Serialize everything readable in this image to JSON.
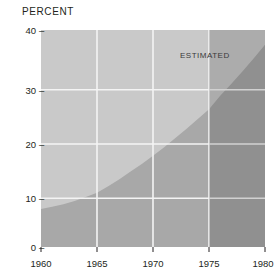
{
  "chart_data": {
    "type": "area",
    "title": "PERCENT",
    "xlabel": "",
    "ylabel": "PERCENT",
    "x": [
      1960,
      1961,
      1962,
      1963,
      1964,
      1965,
      1966,
      1967,
      1968,
      1969,
      1970,
      1971,
      1972,
      1973,
      1974,
      1975,
      1976,
      1977,
      1978,
      1979,
      1980
    ],
    "values": [
      7.0,
      7.4,
      7.9,
      8.5,
      9.2,
      10.0,
      11.2,
      12.5,
      13.9,
      15.3,
      16.8,
      18.4,
      20.1,
      21.8,
      23.6,
      25.4,
      27.9,
      30.1,
      32.4,
      34.8,
      37.3
    ],
    "series": [
      {
        "name": "percent",
        "values": [
          7.0,
          7.4,
          7.9,
          8.5,
          9.2,
          10.0,
          11.2,
          12.5,
          13.9,
          15.3,
          16.8,
          18.4,
          20.1,
          21.8,
          23.6,
          25.4,
          27.9,
          30.1,
          32.4,
          34.8,
          37.3
        ]
      }
    ],
    "xlim": [
      1960,
      1980
    ],
    "ylim": [
      0,
      40
    ],
    "xticks": [
      1960,
      1965,
      1970,
      1975,
      1980
    ],
    "xtick_labels": [
      "1960",
      "1965",
      "1970",
      "1975",
      "1980"
    ],
    "yticks": [
      0,
      10,
      20,
      30,
      40
    ],
    "ytick_labels": [
      "40",
      "30",
      "20",
      "10",
      "0"
    ],
    "grid": true,
    "legend": "none",
    "annotations": [
      {
        "text": "ESTIMATED",
        "x": 1974.0,
        "y": 34.0
      }
    ],
    "estimated_region": {
      "label": "ESTIMATED",
      "start": 1975,
      "end": 1980
    },
    "colors": {
      "plot_background": "#c9c9c9",
      "area_fill": "#a8a8a8",
      "estimated_overlay": "#8a8a8a",
      "gridline": "#f2f2f2",
      "text": "#231f20",
      "page_background": "#ffffff"
    }
  },
  "axis": {
    "ytick_dash": "–",
    "y_labels": [
      "40",
      "30",
      "20",
      "10",
      "0"
    ],
    "x_labels": [
      "1960",
      "1965",
      "1970",
      "1975",
      "1980"
    ]
  }
}
